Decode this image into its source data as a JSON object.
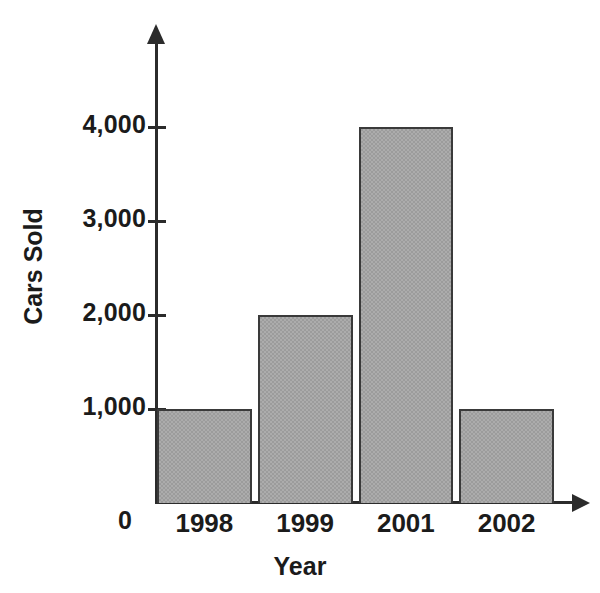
{
  "chart_data": {
    "type": "bar",
    "title": "",
    "subtitle": "",
    "xlabel": "Year",
    "ylabel": "Cars Sold",
    "categories": [
      "1998",
      "1999",
      "2001",
      "2002"
    ],
    "values": [
      1000,
      2000,
      4000,
      1000
    ],
    "series": [
      {
        "name": "Cars Sold",
        "values": [
          1000,
          2000,
          4000,
          1000
        ]
      }
    ],
    "ylim": [
      0,
      4600
    ],
    "xlim": [
      0,
      4
    ],
    "y_tick_labels": [
      "1,000",
      "2,000",
      "3,000",
      "4,000"
    ],
    "y_tick_values": [
      1000,
      2000,
      3000,
      4000
    ],
    "origin_label": "0",
    "grid": false,
    "legend": false,
    "legend_position": "none",
    "bar_fill_color": "#9c9c9c",
    "bar_border_color": "#3a3a3a",
    "axis_color": "#2b2b2b",
    "text_color": "#1b1b1b",
    "background_color": "#ffffff",
    "annotations": []
  },
  "axes": {
    "y_axis_name": "vertical-axis",
    "x_axis_name": "horizontal-axis"
  }
}
